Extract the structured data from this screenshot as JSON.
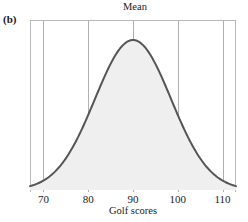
{
  "figure": {
    "panel_letter": "(b)",
    "title": "Mean",
    "xlabel": "Golf scores",
    "ylabel": "Frequency"
  },
  "colors": {
    "curve": "#555555",
    "fill": "#efefef",
    "gridline": "#b0b0b0",
    "frame": "#b9b9b9",
    "text": "#1a1a1a",
    "background": "#ffffff"
  },
  "ticks": [
    {
      "label": "70",
      "value": 70
    },
    {
      "label": "80",
      "value": 80
    },
    {
      "label": "90",
      "value": 90
    },
    {
      "label": "100",
      "value": 100
    },
    {
      "label": "110",
      "value": 110
    }
  ],
  "chart_data": {
    "type": "area",
    "title": "Mean",
    "subtitle": "(b)",
    "xlabel": "Golf scores",
    "ylabel": "Frequency",
    "xlim": [
      67,
      113
    ],
    "ylim": [
      0,
      1
    ],
    "grid": true,
    "legend": null,
    "annotations": [
      {
        "text": "Mean",
        "x": 90,
        "note": "vertical gridline at the mean marks the center of the symmetric distribution"
      }
    ],
    "distribution": {
      "shape": "normal",
      "mean": 90,
      "std_dev": 8.5,
      "symmetric": true,
      "filled": true
    },
    "x": [
      67,
      70,
      73,
      76,
      79,
      82,
      85,
      88,
      90,
      92,
      95,
      98,
      101,
      104,
      107,
      110,
      113
    ],
    "y": [
      0.004,
      0.017,
      0.051,
      0.122,
      0.245,
      0.438,
      0.703,
      0.944,
      1.0,
      0.944,
      0.703,
      0.438,
      0.245,
      0.122,
      0.051,
      0.017,
      0.004
    ],
    "series": [
      {
        "name": "Golf score frequency",
        "values": [
          0.004,
          0.017,
          0.051,
          0.122,
          0.245,
          0.438,
          0.703,
          0.944,
          1.0,
          0.944,
          0.703,
          0.438,
          0.245,
          0.122,
          0.051,
          0.017,
          0.004
        ]
      }
    ]
  }
}
